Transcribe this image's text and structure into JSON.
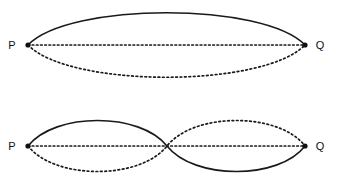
{
  "figure": {
    "background_color": "#ffffff",
    "stroke_color": "#1a1a1a",
    "label_color": "#111111",
    "width": 337,
    "height": 188
  },
  "labels": {
    "left_endpoint": "P",
    "right_endpoint": "Q"
  },
  "panels": [
    {
      "id": "panel-fundamental",
      "name": "fundamental-mode",
      "mode_order": 1,
      "nodes": 2,
      "antinodes": 1,
      "left_label": "P",
      "right_label": "Q",
      "endpoints": {
        "x1": 28,
        "y": 45,
        "x2": 305
      },
      "axis": {
        "style": "dotted",
        "y": 45,
        "x1": 28,
        "x2": 305
      },
      "curves": [
        {
          "name": "crest-solid",
          "style": "solid",
          "phase": "positive",
          "path": "M 28 45 C 70 2 263 2 305 45"
        },
        {
          "name": "trough-dotted",
          "style": "dotted",
          "phase": "negative",
          "path": "M 28 45 C 70 88 263 88 305 45"
        }
      ]
    },
    {
      "id": "panel-second-harmonic",
      "name": "second-harmonic-mode",
      "mode_order": 2,
      "nodes": 3,
      "antinodes": 2,
      "left_label": "P",
      "right_label": "Q",
      "endpoints": {
        "x1": 28,
        "y": 146,
        "x2": 305
      },
      "axis": {
        "style": "dotted",
        "y": 146,
        "x1": 28,
        "x2": 305
      },
      "node_middle": {
        "x": 167,
        "y": 146
      },
      "curves": [
        {
          "name": "solid-crest-then-trough",
          "style": "solid",
          "phase": "positive-then-negative",
          "path": "M 28 146 C 55 112 140 112 167 146 C 194 180 279 180 305 146"
        },
        {
          "name": "dotted-trough-then-crest",
          "style": "dotted",
          "phase": "negative-then-positive",
          "path": "M 28 146 C 55 180 140 180 167 146 C 194 112 279 112 305 146"
        }
      ]
    }
  ],
  "markers": {
    "endpoint_dot_radius": 2.6,
    "endpoint_dot_color": "#111111"
  },
  "stroke_widths": {
    "solid": 1.6,
    "dotted": 1.7
  },
  "dash_patterns": {
    "axis": "1.6 2.6",
    "curve": "1.7 2.7"
  }
}
